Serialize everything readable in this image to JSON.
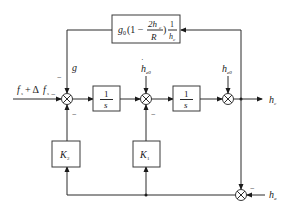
{
  "diagram": {
    "type": "control-block-diagram",
    "blocks": {
      "feedback_gain": {
        "prefix": "g",
        "prefix_sub": "0",
        "paren_open": "(1 −",
        "num": "2h",
        "num_sub": "c",
        "den": "R",
        "paren_close": ")",
        "frac2_num": "1",
        "frac2_den": "h",
        "frac2_den_sub": "c"
      },
      "integrator_1": {
        "num": "1",
        "den": "s"
      },
      "integrator_2": {
        "num": "1",
        "den": "s"
      },
      "gain_k2": {
        "label": "K",
        "sub": "2"
      },
      "gain_k1": {
        "label": "K",
        "sub": "1"
      }
    },
    "signals": {
      "input": {
        "label": "f",
        "sub": "s",
        "plus": "+ Δ",
        "label2": "f",
        "sub2": "s"
      },
      "g": {
        "label": "g"
      },
      "h_dot_e0": {
        "label": "h",
        "sub": "e0",
        "dot": "·"
      },
      "h_e0": {
        "label": "h",
        "sub": "e0"
      },
      "output": {
        "label": "h",
        "sub": "c"
      },
      "measured": {
        "label": "h",
        "sub": "a"
      }
    },
    "signs": {
      "minus": "−"
    },
    "summing_junction_symbol": "⊗"
  }
}
